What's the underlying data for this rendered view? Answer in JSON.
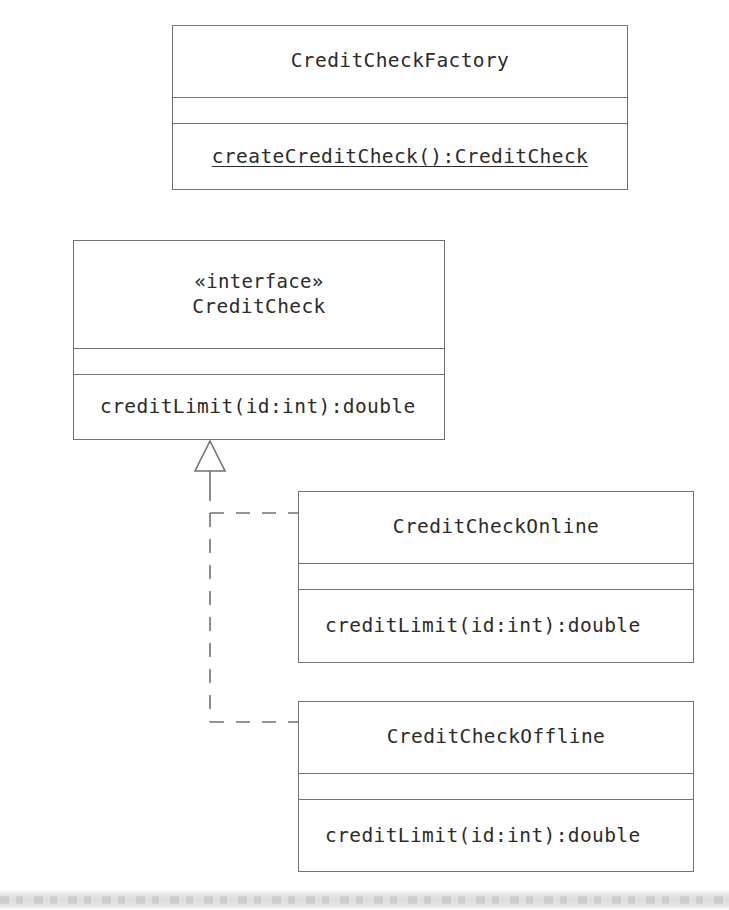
{
  "diagram": {
    "type": "uml-class-diagram",
    "stroke_color": "#6f7173",
    "text_color": "#2b2b2b",
    "background": "#ffffff"
  },
  "classes": [
    {
      "id": "credit-check-factory",
      "stereotype": "",
      "name": "CreditCheckFactory",
      "attributes": [],
      "operations": [
        {
          "signature": "createCreditCheck():CreditCheck",
          "static": true,
          "align": "center"
        }
      ]
    },
    {
      "id": "credit-check",
      "stereotype": "«interface»",
      "name": "CreditCheck",
      "attributes": [],
      "operations": [
        {
          "signature": "creditLimit(id:int):double",
          "static": false,
          "align": "left"
        }
      ]
    },
    {
      "id": "credit-check-online",
      "stereotype": "",
      "name": "CreditCheckOnline",
      "attributes": [],
      "operations": [
        {
          "signature": "creditLimit(id:int):double",
          "static": false,
          "align": "left"
        }
      ]
    },
    {
      "id": "credit-check-offline",
      "stereotype": "",
      "name": "CreditCheckOffline",
      "attributes": [],
      "operations": [
        {
          "signature": "creditLimit(id:int):double",
          "static": false,
          "align": "left"
        }
      ]
    }
  ],
  "relationships": [
    {
      "id": "realization-online",
      "kind": "realization",
      "line_style": "dashed",
      "arrow": "hollow-triangle",
      "from": "CreditCheckOnline",
      "to": "CreditCheck"
    },
    {
      "id": "realization-offline",
      "kind": "realization",
      "line_style": "dashed",
      "arrow": "hollow-triangle",
      "from": "CreditCheckOffline",
      "to": "CreditCheck"
    }
  ]
}
